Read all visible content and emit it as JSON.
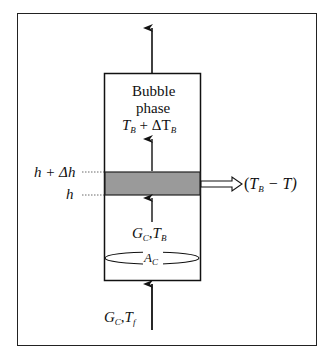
{
  "diagram": {
    "type": "bubble-phase-column-energy-balance",
    "box_title_line1": "Bubble",
    "box_title_line2": "phase",
    "top_temperature": {
      "main": "T",
      "sub": "B",
      "op": " + ΔT",
      "sub2": "B"
    },
    "upper_height": {
      "text": "h + Δh"
    },
    "lower_height": {
      "text": "h"
    },
    "heat_transfer": {
      "open": "(",
      "T": "T",
      "sub": "B",
      "rest": " − T)"
    },
    "inner_flow": {
      "G": "G",
      "Gsub": "C",
      "sep": ",",
      "T": "T",
      "Tsub": "B"
    },
    "cross_section": {
      "A": "A",
      "Asub": "C"
    },
    "feed": {
      "G": "G",
      "Gsub": "C",
      "sep": ",",
      "T": "T",
      "Tsub": "f"
    },
    "colors": {
      "line": "#111111",
      "shaded_slice": "#9a9a9a",
      "background": "#ffffff"
    }
  }
}
